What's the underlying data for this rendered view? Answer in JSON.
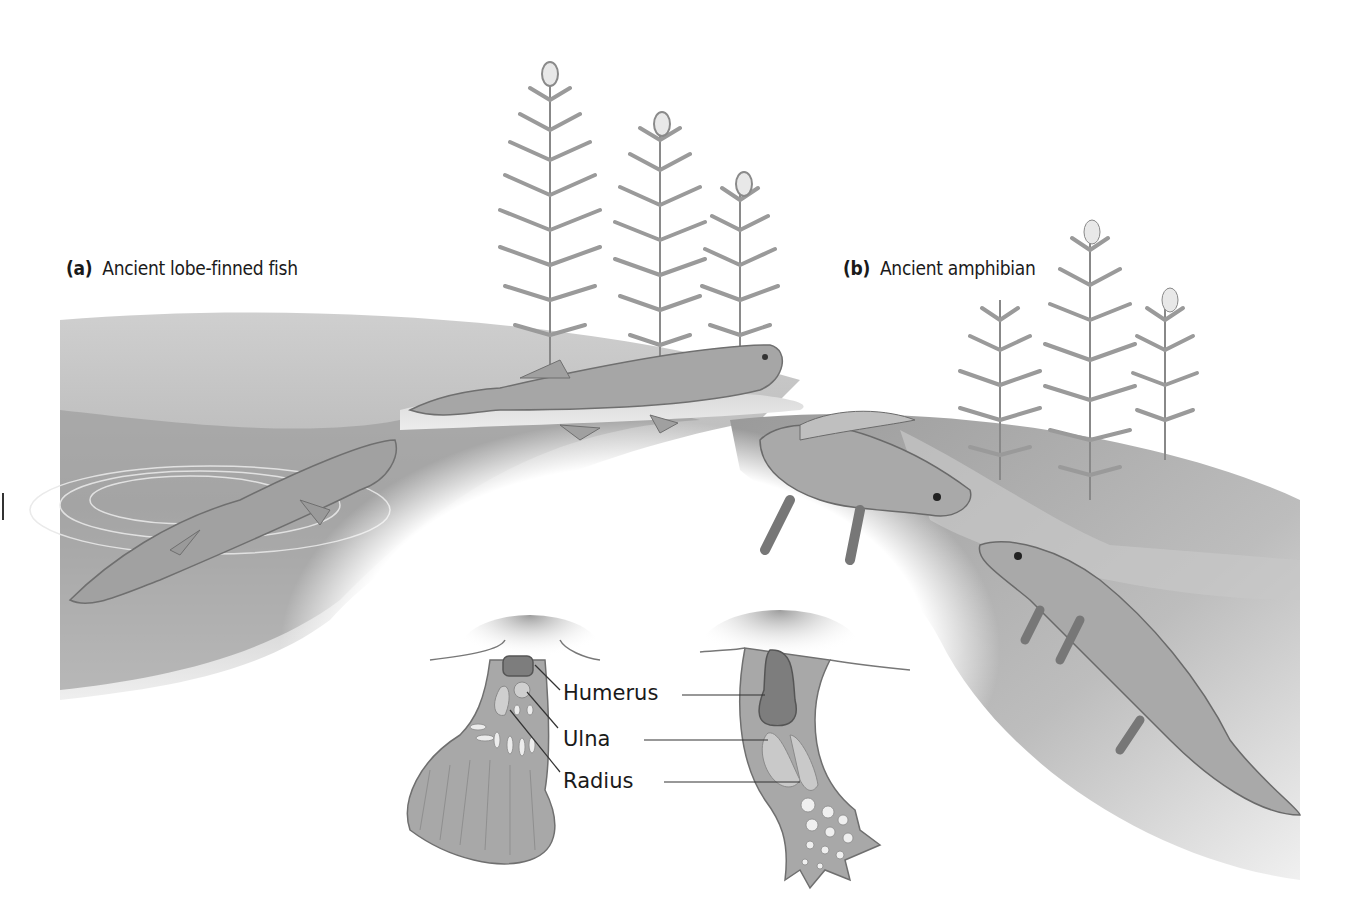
{
  "panels": {
    "a": {
      "letter": "(a)",
      "title": "Ancient lobe-finned fish"
    },
    "b": {
      "letter": "(b)",
      "title": "Ancient amphibian"
    }
  },
  "bones": {
    "humerus": "Humerus",
    "ulna": "Ulna",
    "radius": "Radius"
  },
  "colors": {
    "ground_dark": "#8f8f8f",
    "ground_light": "#f4f4f4",
    "limb": "#a8a8a8",
    "humerus": "#7c7c7c",
    "bone_light": "#c9c9c9",
    "plant": "#9a9a9a"
  }
}
